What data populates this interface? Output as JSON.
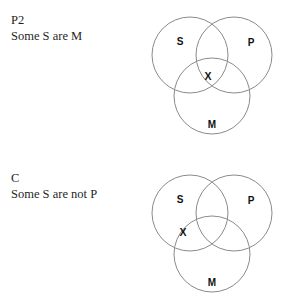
{
  "page": {
    "background_color": "#ffffff",
    "stroke_color": "#8a8a8a",
    "text_color": "#1a1a1a"
  },
  "blocks": [
    {
      "id": "premise-2",
      "tag": "P2",
      "statement": "Some S are M",
      "diagram": {
        "type": "venn3",
        "circles": [
          {
            "label": "S",
            "cx": 42,
            "cy": 51,
            "r": 38,
            "label_x": 32,
            "label_y": 38
          },
          {
            "label": "P",
            "cx": 86,
            "cy": 51,
            "r": 38,
            "label_x": 103,
            "label_y": 39
          },
          {
            "label": "M",
            "cx": 64,
            "cy": 92,
            "r": 38,
            "label_x": 64,
            "label_y": 121
          }
        ],
        "markers": [
          {
            "label": "X",
            "x": 60,
            "y": 73,
            "region": "S-and-M"
          }
        ]
      }
    },
    {
      "id": "conclusion",
      "tag": "C",
      "statement": "Some S are not P",
      "diagram": {
        "type": "venn3",
        "circles": [
          {
            "label": "S",
            "cx": 42,
            "cy": 51,
            "r": 38,
            "label_x": 32,
            "label_y": 38
          },
          {
            "label": "P",
            "cx": 86,
            "cy": 51,
            "r": 38,
            "label_x": 103,
            "label_y": 39
          },
          {
            "label": "M",
            "cx": 64,
            "cy": 92,
            "r": 38,
            "label_x": 64,
            "label_y": 121
          }
        ],
        "markers": [
          {
            "label": "X",
            "x": 35,
            "y": 71,
            "region": "S-and-M-not-P"
          }
        ]
      }
    }
  ]
}
